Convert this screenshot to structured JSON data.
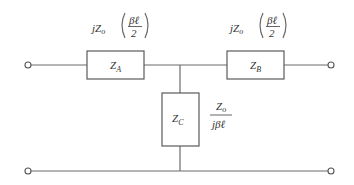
{
  "diagram": {
    "type": "T-network equivalent circuit",
    "colors": {
      "line": "#6b6b6b",
      "text": "#333333",
      "background": "#ffffff"
    },
    "components": [
      {
        "id": "ZA",
        "label_main": "Z",
        "label_sub": "A",
        "position": "series-left",
        "value": {
          "prefix": "jZ",
          "prefix_sub": "o",
          "num": "βℓ",
          "den": "2"
        }
      },
      {
        "id": "ZB",
        "label_main": "Z",
        "label_sub": "B",
        "position": "series-right",
        "value": {
          "prefix": "jZ",
          "prefix_sub": "o",
          "num": "βℓ",
          "den": "2"
        }
      },
      {
        "id": "ZC",
        "label_main": "Z",
        "label_sub": "C",
        "position": "shunt",
        "value": {
          "num_main": "Z",
          "num_sub": "o",
          "den": "jβℓ"
        }
      }
    ],
    "terminals": [
      "input-top",
      "input-bottom",
      "output-top",
      "output-bottom"
    ]
  }
}
